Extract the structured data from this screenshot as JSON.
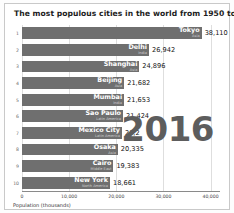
{
  "chart_data": {
    "type": "bar",
    "orientation": "horizontal",
    "title": "The most populous cities in the world from 1950 to 2018",
    "xlabel": "Population (thousands)",
    "ylabel": "",
    "xlim": [
      0,
      42000
    ],
    "xticks": [
      0,
      10000,
      20000,
      30000,
      40000
    ],
    "xtick_labels": [
      "0",
      "10,000",
      "20,000",
      "30,000",
      "40,000"
    ],
    "grid": true,
    "legend": false,
    "annotation_year": "2016",
    "categories": [
      "Tokyo",
      "Delhi",
      "Shanghai",
      "Beijing",
      "Mumbai",
      "Sao Paulo",
      "Mexico City",
      "Osaka",
      "Cairo",
      "New York"
    ],
    "values": [
      38110,
      26942,
      24896,
      21682,
      21653,
      21424,
      21200,
      20335,
      19383,
      18661
    ],
    "value_labels": [
      "38,110",
      "26,942",
      "24,896",
      "21,682",
      "21,653",
      "21,424",
      "21,2",
      "20,335",
      "19,383",
      "18,661"
    ],
    "ranks": [
      "1",
      "2",
      "3",
      "4",
      "5",
      "6",
      "7",
      "8",
      "9",
      "10"
    ],
    "regions": [
      "Asia",
      "India",
      "Asia",
      "Asia",
      "India",
      "Latin America",
      "Latin America",
      "Asia",
      "Middle East",
      "North America"
    ],
    "bar_color": "#6f6f6f",
    "bars": [
      {
        "rank": "1",
        "city": "Tokyo",
        "region": "Asia",
        "value": 38110,
        "value_label": "38,110"
      },
      {
        "rank": "2",
        "city": "Delhi",
        "region": "India",
        "value": 26942,
        "value_label": "26,942"
      },
      {
        "rank": "3",
        "city": "Shanghai",
        "region": "Asia",
        "value": 24896,
        "value_label": "24,896"
      },
      {
        "rank": "4",
        "city": "Beijing",
        "region": "Asia",
        "value": 21682,
        "value_label": "21,682"
      },
      {
        "rank": "5",
        "city": "Mumbai",
        "region": "India",
        "value": 21653,
        "value_label": "21,653"
      },
      {
        "rank": "6",
        "city": "Sao Paulo",
        "region": "Latin America",
        "value": 21424,
        "value_label": "21,424"
      },
      {
        "rank": "7",
        "city": "Mexico City",
        "region": "Latin America",
        "value": 21200,
        "value_label": "21,2"
      },
      {
        "rank": "8",
        "city": "Osaka",
        "region": "Asia",
        "value": 20335,
        "value_label": "20,335"
      },
      {
        "rank": "9",
        "city": "Cairo",
        "region": "Middle East",
        "value": 19383,
        "value_label": "19,383"
      },
      {
        "rank": "10",
        "city": "New York",
        "region": "North America",
        "value": 18661,
        "value_label": "18,661"
      }
    ]
  }
}
